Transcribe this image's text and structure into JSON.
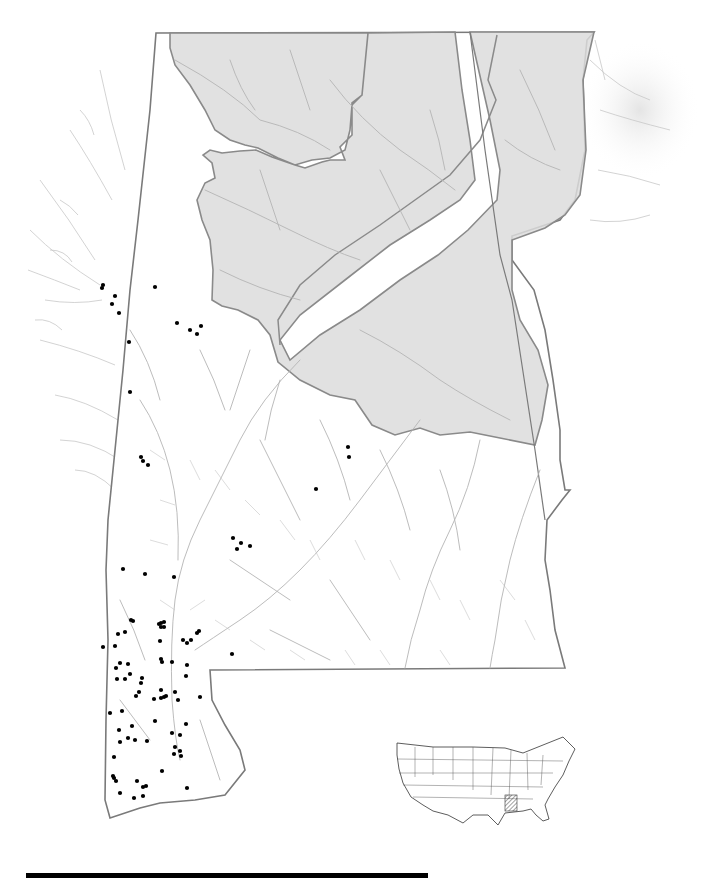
{
  "map": {
    "title": "",
    "colors": {
      "background": "#ffffff",
      "upland_fill": "#dcdcdc",
      "upland_border": "#8a8a8a",
      "state_border": "#7a7a7a",
      "river": "#b4b4b4",
      "occurrence_dot": "#000000"
    },
    "legend": [],
    "occurrence_points": [
      [
        103,
        285
      ],
      [
        102,
        288
      ],
      [
        115,
        296
      ],
      [
        112,
        304
      ],
      [
        119,
        313
      ],
      [
        155,
        287
      ],
      [
        177,
        323
      ],
      [
        190,
        330
      ],
      [
        197,
        334
      ],
      [
        201,
        326
      ],
      [
        129,
        342
      ],
      [
        130,
        392
      ],
      [
        143,
        461
      ],
      [
        141,
        457
      ],
      [
        148,
        465
      ],
      [
        348,
        447
      ],
      [
        349,
        457
      ],
      [
        316,
        489
      ],
      [
        233,
        538
      ],
      [
        241,
        543
      ],
      [
        237,
        549
      ],
      [
        250,
        546
      ],
      [
        123,
        569
      ],
      [
        145,
        574
      ],
      [
        174,
        577
      ],
      [
        131,
        620
      ],
      [
        133,
        621
      ],
      [
        161,
        623
      ],
      [
        159,
        624
      ],
      [
        164,
        622
      ],
      [
        161,
        627
      ],
      [
        164,
        627
      ],
      [
        199,
        631
      ],
      [
        197,
        633
      ],
      [
        125,
        632
      ],
      [
        118,
        634
      ],
      [
        160,
        641
      ],
      [
        187,
        643
      ],
      [
        115,
        646
      ],
      [
        103,
        647
      ],
      [
        183,
        640
      ],
      [
        191,
        640
      ],
      [
        161,
        659
      ],
      [
        162,
        662
      ],
      [
        128,
        664
      ],
      [
        116,
        668
      ],
      [
        120,
        663
      ],
      [
        187,
        665
      ],
      [
        172,
        662
      ],
      [
        130,
        674
      ],
      [
        117,
        679
      ],
      [
        142,
        678
      ],
      [
        186,
        676
      ],
      [
        161,
        690
      ],
      [
        141,
        683
      ],
      [
        125,
        679
      ],
      [
        178,
        700
      ],
      [
        164,
        697
      ],
      [
        175,
        692
      ],
      [
        166,
        696
      ],
      [
        200,
        697
      ],
      [
        110,
        713
      ],
      [
        122,
        711
      ],
      [
        119,
        730
      ],
      [
        132,
        726
      ],
      [
        136,
        696
      ],
      [
        139,
        692
      ],
      [
        161,
        698
      ],
      [
        154,
        699
      ],
      [
        135,
        740
      ],
      [
        147,
        741
      ],
      [
        172,
        733
      ],
      [
        180,
        735
      ],
      [
        186,
        724
      ],
      [
        114,
        757
      ],
      [
        180,
        751
      ],
      [
        175,
        747
      ],
      [
        174,
        754
      ],
      [
        181,
        756
      ],
      [
        162,
        771
      ],
      [
        128,
        738
      ],
      [
        155,
        721
      ],
      [
        120,
        742
      ],
      [
        114,
        778
      ],
      [
        113,
        776
      ],
      [
        116,
        781
      ],
      [
        120,
        793
      ],
      [
        143,
        787
      ],
      [
        137,
        781
      ],
      [
        146,
        786
      ],
      [
        134,
        798
      ],
      [
        143,
        796
      ],
      [
        187,
        788
      ],
      [
        232,
        654
      ]
    ]
  },
  "inset": {
    "name": "United States locator",
    "highlight": "Alabama/Mississippi drainage (hatched)"
  },
  "scale_bar": {
    "label": ""
  }
}
